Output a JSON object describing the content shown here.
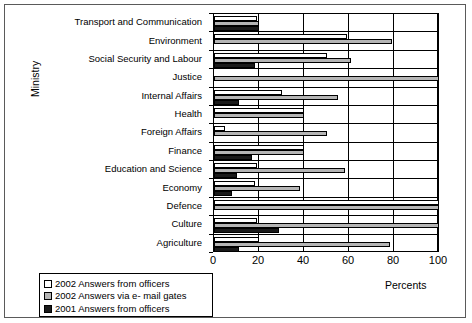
{
  "chart_data": {
    "type": "bar",
    "orientation": "horizontal",
    "title": "",
    "xlabel": "Percents",
    "ylabel": "Ministry",
    "xlim": [
      0,
      100
    ],
    "xticks": [
      0,
      20,
      40,
      60,
      80,
      100
    ],
    "grid": true,
    "legend_position": "below-left",
    "categories": [
      "Transport and Communication",
      "Environment",
      "Social Security and Labour",
      "Justice",
      "Internal Affairs",
      "Health",
      "Foreign Affairs",
      "Finance",
      "Education and Science",
      "Economy",
      "Defence",
      "Culture",
      "Agriculture"
    ],
    "series": [
      {
        "name": "2002 Answers from officers",
        "color": "#ffffff",
        "values": [
          19,
          59,
          50,
          0,
          30,
          40,
          5,
          40,
          19,
          18,
          100,
          19,
          20
        ]
      },
      {
        "name": "2002 Answers via e- mail gates",
        "color": "#b5b5b5",
        "values": [
          20,
          79,
          61,
          100,
          55,
          40,
          50,
          40,
          58,
          38,
          100,
          100,
          78
        ]
      },
      {
        "name": "2001 Answers from officers",
        "color": "#1a1a1a",
        "values": [
          20,
          0,
          18,
          0,
          11,
          0,
          0,
          17,
          10,
          8,
          0,
          29,
          11
        ]
      }
    ]
  },
  "legend": {
    "items": [
      "2002 Answers from officers",
      "2002 Answers via e- mail gates",
      "2001 Answers from officers"
    ]
  }
}
